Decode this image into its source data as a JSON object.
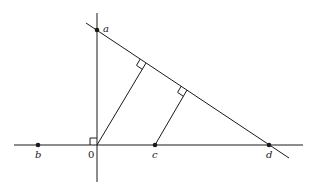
{
  "diagram": {
    "type": "geometric-construction",
    "line_color": "#1a1a1a",
    "points": [
      {
        "id": "a",
        "label": "a",
        "x": 97,
        "y": 30,
        "dot": true
      },
      {
        "id": "b",
        "label": "b",
        "x": 38,
        "y": 145,
        "dot": true
      },
      {
        "id": "o",
        "label": "0",
        "x": 97,
        "y": 145,
        "dot": false
      },
      {
        "id": "c",
        "label": "c",
        "x": 155,
        "y": 145,
        "dot": true
      },
      {
        "id": "d",
        "label": "d",
        "x": 269,
        "y": 145,
        "dot": true
      }
    ],
    "labels": {
      "a": "a",
      "b": "b",
      "o": "0",
      "c": "c",
      "d": "d"
    }
  }
}
